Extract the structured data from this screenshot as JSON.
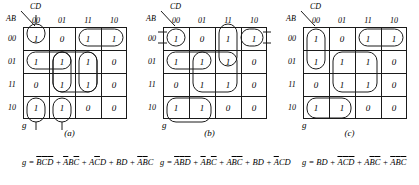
{
  "figure": {
    "variables": [
      "A",
      "B",
      "C",
      "D"
    ],
    "col_header_label": "CD",
    "row_header_label": "AB",
    "col_headers": [
      "00",
      "01",
      "11",
      "10"
    ],
    "row_headers": [
      "00",
      "01",
      "11",
      "10"
    ],
    "output_label": "g"
  },
  "maps": [
    {
      "id": "a",
      "caption": "(a)",
      "values": [
        [
          "1",
          "0",
          "1",
          "1"
        ],
        [
          "1",
          "1",
          "1",
          "0"
        ],
        [
          "0",
          "1",
          "1",
          "0"
        ],
        [
          "1",
          "1",
          "0",
          "0"
        ]
      ],
      "equation_plain": "g = B'C'D' + A'BC' + AC'D + BD + A'B'C",
      "equation_tokens": [
        {
          "t": "g",
          "bar": false
        },
        {
          "t": " = ",
          "bar": false
        },
        {
          "t": "B",
          "bar": true
        },
        {
          "t": "C",
          "bar": true
        },
        {
          "t": "D",
          "bar": true
        },
        {
          "t": " + ",
          "bar": false
        },
        {
          "t": "A",
          "bar": true
        },
        {
          "t": "B",
          "bar": false
        },
        {
          "t": "C",
          "bar": true
        },
        {
          "t": " + ",
          "bar": false
        },
        {
          "t": "A",
          "bar": false
        },
        {
          "t": "C",
          "bar": true
        },
        {
          "t": "D",
          "bar": false
        },
        {
          "t": " + ",
          "bar": false
        },
        {
          "t": "B",
          "bar": false
        },
        {
          "t": "D",
          "bar": false
        },
        {
          "t": " + ",
          "bar": false
        },
        {
          "t": "A",
          "bar": true
        },
        {
          "t": "B",
          "bar": true
        },
        {
          "t": "C",
          "bar": false
        }
      ]
    },
    {
      "id": "b",
      "caption": "(b)",
      "values": [
        [
          "1",
          "0",
          "1",
          "1"
        ],
        [
          "1",
          "1",
          "1",
          "0"
        ],
        [
          "0",
          "1",
          "1",
          "0"
        ],
        [
          "1",
          "1",
          "0",
          "0"
        ]
      ],
      "equation_plain": "g = A'B'D' + A'BC' + AB'C' + BD + A'CD",
      "equation_tokens": [
        {
          "t": "g",
          "bar": false
        },
        {
          "t": " = ",
          "bar": false
        },
        {
          "t": "A",
          "bar": true
        },
        {
          "t": "B",
          "bar": true
        },
        {
          "t": "D",
          "bar": true
        },
        {
          "t": " + ",
          "bar": false
        },
        {
          "t": "A",
          "bar": true
        },
        {
          "t": "B",
          "bar": false
        },
        {
          "t": "C",
          "bar": true
        },
        {
          "t": " + ",
          "bar": false
        },
        {
          "t": "A",
          "bar": false
        },
        {
          "t": "B",
          "bar": true
        },
        {
          "t": "C",
          "bar": true
        },
        {
          "t": " + ",
          "bar": false
        },
        {
          "t": "B",
          "bar": false
        },
        {
          "t": "D",
          "bar": false
        },
        {
          "t": " + ",
          "bar": false
        },
        {
          "t": "A",
          "bar": true
        },
        {
          "t": "C",
          "bar": false
        },
        {
          "t": "D",
          "bar": false
        }
      ]
    },
    {
      "id": "c",
      "caption": "(c)",
      "values": [
        [
          "1",
          "0",
          "1",
          "1"
        ],
        [
          "1",
          "1",
          "1",
          "0"
        ],
        [
          "0",
          "1",
          "1",
          "0"
        ],
        [
          "1",
          "1",
          "0",
          "0"
        ]
      ],
      "equation_plain": "g = BD + A'C'D' + AB'C' + A'B'C'",
      "equation_tokens": [
        {
          "t": "g",
          "bar": false
        },
        {
          "t": " = ",
          "bar": false
        },
        {
          "t": "B",
          "bar": false
        },
        {
          "t": "D",
          "bar": false
        },
        {
          "t": " + ",
          "bar": false
        },
        {
          "t": "A",
          "bar": true
        },
        {
          "t": "C",
          "bar": true
        },
        {
          "t": "D",
          "bar": true
        },
        {
          "t": " + ",
          "bar": false
        },
        {
          "t": "A",
          "bar": false
        },
        {
          "t": "B",
          "bar": true
        },
        {
          "t": "C",
          "bar": true
        },
        {
          "t": " + ",
          "bar": false
        },
        {
          "t": "A",
          "bar": true
        },
        {
          "t": "B",
          "bar": true
        },
        {
          "t": "C",
          "bar": true
        }
      ]
    }
  ]
}
